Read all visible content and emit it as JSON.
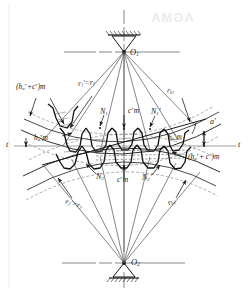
{
  "figure": {
    "background_color": "#ffffff",
    "line_color": "#1a1a1a",
    "thin_line_color": "#555555",
    "width": 249,
    "height": 293
  },
  "centers": {
    "top": {
      "label": "O",
      "sub": "1",
      "x": 124,
      "y": 52
    },
    "bottom": {
      "label": "O",
      "sub": "2",
      "x": 124,
      "y": 266
    }
  },
  "pitch_line": {
    "left_label": "t",
    "right_label": "t",
    "y": 146
  },
  "labels": {
    "addendum_plus_clearance_top": {
      "base": "(h",
      "sub1": "a",
      "sup1": "*",
      "plus": "+c",
      "sup2": "*",
      "close": ")m"
    },
    "addendum_plus_clearance_bottom": {
      "base": "(h",
      "sub1": "a",
      "sup1": "*",
      "plus": "+ c",
      "sup2": "*",
      "close": ")m"
    },
    "pitch_radius_1": {
      "base": "r",
      "sub": "1",
      "prime": "'",
      "eq": "=r",
      "sub2": "1"
    },
    "base_radius_1": {
      "base": "r",
      "sub": "b1"
    },
    "pitch_radius_2": {
      "base": "r",
      "sub": "2",
      "prime": "'",
      "eq": "=r",
      "sub2": "2"
    },
    "base_radius_2": {
      "base": "r",
      "sub": "b2"
    },
    "addendum_left": {
      "base": "h",
      "sub": "a",
      "sup": "*",
      "tail": "m"
    },
    "addendum_right": {
      "base": "h",
      "sub": "a",
      "sup": "*",
      "tail": "m"
    },
    "clearance_top": {
      "base": "c",
      "sup": "*",
      "tail": "m"
    },
    "clearance_bottom": {
      "base": "c",
      "sup": "*",
      "tail": "m"
    },
    "point_N1": {
      "base": "N",
      "sub": "1"
    },
    "point_N1p": {
      "base": "N",
      "sub": "1",
      "prime": "'"
    },
    "point_N2": {
      "base": "N",
      "sub": "2"
    },
    "point_N2p": {
      "base": "N",
      "sub": "2",
      "prime": "'"
    },
    "pressure_angle": {
      "base": "a",
      "prime": "'"
    }
  },
  "watermark": {
    "text": "AGMA",
    "visible": true
  }
}
